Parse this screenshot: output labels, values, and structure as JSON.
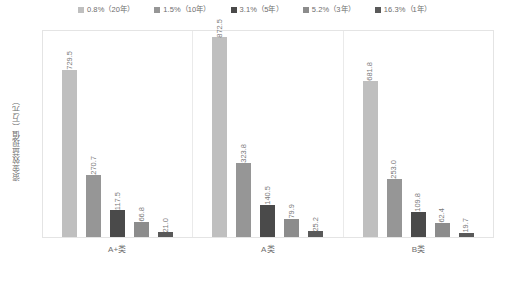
{
  "chart_data": {
    "type": "bar",
    "title": "",
    "xlabel": "",
    "ylabel": "资金效益现值（万元）",
    "grid": false,
    "legend_position": "top",
    "ylim": [
      0,
      900
    ],
    "categories": [
      "A+类",
      "A类",
      "B类"
    ],
    "series": [
      {
        "name": "0.8%（20年）",
        "color": "#bfbfbf",
        "values": [
          729.5,
          872.5,
          681.8
        ],
        "labels": [
          "729.5",
          "872.5",
          "681.8"
        ]
      },
      {
        "name": "1.5%（10年）",
        "color": "#969696",
        "values": [
          270.7,
          323.8,
          253.0
        ],
        "labels": [
          "270.7",
          "323.8",
          "253.0"
        ]
      },
      {
        "name": "3.1%（5年）",
        "color": "#4a4a4a",
        "values": [
          117.5,
          140.5,
          109.8
        ],
        "labels": [
          "117.5",
          "140.5",
          "109.8"
        ]
      },
      {
        "name": "5.2%（3年）",
        "color": "#8c8c8c",
        "values": [
          66.8,
          79.9,
          62.4
        ],
        "labels": [
          "66.8",
          "79.9",
          "62.4"
        ]
      },
      {
        "name": "16.3%（1年）",
        "color": "#595959",
        "values": [
          21.0,
          25.2,
          19.7
        ],
        "labels": [
          "21.0",
          "25.2",
          "19.7"
        ]
      }
    ]
  },
  "legend": {
    "items": [
      {
        "label": "0.8%（20年）",
        "color": "#bfbfbf"
      },
      {
        "label": "1.5%（10年）",
        "color": "#969696"
      },
      {
        "label": "3.1%（5年）",
        "color": "#4a4a4a"
      },
      {
        "label": "5.2%（3年）",
        "color": "#8c8c8c"
      },
      {
        "label": "16.3%（1年）",
        "color": "#595959"
      }
    ]
  },
  "axes": {
    "y_title": "资金效益现值（万元）",
    "x_ticks": [
      "A+类",
      "A类",
      "B类"
    ]
  },
  "caption": ""
}
